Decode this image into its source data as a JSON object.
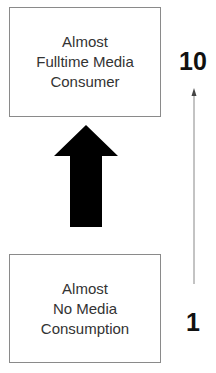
{
  "diagram": {
    "top_box": {
      "lines": [
        "Almost",
        "Fulltime Media",
        "Consumer"
      ]
    },
    "bottom_box": {
      "lines": [
        "Almost",
        "No Media",
        "Consumption"
      ]
    },
    "scale": {
      "top_label": "10",
      "bottom_label": "1"
    },
    "arrow": {
      "direction": "up",
      "color": "#000000"
    }
  }
}
